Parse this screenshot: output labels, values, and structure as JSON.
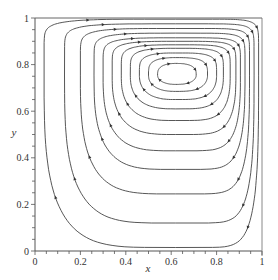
{
  "chart_data": {
    "type": "line",
    "subtype": "streamlines",
    "title": "",
    "xlabel": "x",
    "ylabel": "y",
    "xlim": [
      0,
      1
    ],
    "ylim": [
      0,
      1
    ],
    "xticks": [
      0,
      0.2,
      0.4,
      0.6,
      0.8,
      1
    ],
    "yticks": [
      0,
      0.2,
      0.4,
      0.6,
      0.8,
      1
    ],
    "xtick_labels": [
      "0",
      "0.2",
      "0.4",
      "0.6",
      "0.8",
      "1"
    ],
    "ytick_labels": [
      "0",
      "0.2",
      "0.4",
      "0.6",
      "0.8",
      "1"
    ],
    "grid": false,
    "legend": null,
    "vortex_center": {
      "x": 0.62,
      "y": 0.755
    },
    "flow_direction": "clockwise",
    "line_color": "#444444",
    "streamlines": [
      {
        "level": 1,
        "left": 0.04,
        "right": 0.985,
        "bottom": 0.015,
        "top": 0.995
      },
      {
        "level": 2,
        "left": 0.13,
        "right": 0.965,
        "bottom": 0.12,
        "top": 0.975
      },
      {
        "level": 3,
        "left": 0.2,
        "right": 0.945,
        "bottom": 0.245,
        "top": 0.955
      },
      {
        "level": 4,
        "left": 0.26,
        "right": 0.925,
        "bottom": 0.35,
        "top": 0.935
      },
      {
        "level": 5,
        "left": 0.3,
        "right": 0.905,
        "bottom": 0.43,
        "top": 0.915
      },
      {
        "level": 6,
        "left": 0.34,
        "right": 0.885,
        "bottom": 0.5,
        "top": 0.9
      },
      {
        "level": 7,
        "left": 0.38,
        "right": 0.86,
        "bottom": 0.56,
        "top": 0.885
      },
      {
        "level": 8,
        "left": 0.42,
        "right": 0.83,
        "bottom": 0.61,
        "top": 0.87
      },
      {
        "level": 9,
        "left": 0.46,
        "right": 0.8,
        "bottom": 0.65,
        "top": 0.85
      },
      {
        "level": 10,
        "left": 0.5,
        "right": 0.76,
        "bottom": 0.685,
        "top": 0.83
      },
      {
        "level": 11,
        "left": 0.54,
        "right": 0.71,
        "bottom": 0.715,
        "top": 0.805
      }
    ],
    "annotations": []
  }
}
